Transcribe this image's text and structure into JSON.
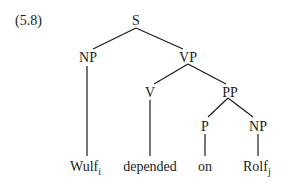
{
  "example_number": "(5.8)",
  "tree": {
    "nodes": [
      {
        "id": "S",
        "label": "S"
      },
      {
        "id": "NP1",
        "label": "NP"
      },
      {
        "id": "VP",
        "label": "VP"
      },
      {
        "id": "V",
        "label": "V"
      },
      {
        "id": "PP",
        "label": "PP"
      },
      {
        "id": "P",
        "label": "P"
      },
      {
        "id": "NP2",
        "label": "NP"
      }
    ],
    "leaves": [
      {
        "id": "w1",
        "text": "Wulf",
        "subscript": "i",
        "parent": "NP1"
      },
      {
        "id": "w2",
        "text": "depended",
        "subscript": "",
        "parent": "V"
      },
      {
        "id": "w3",
        "text": "on",
        "subscript": "",
        "parent": "P"
      },
      {
        "id": "w4",
        "text": "Rolf",
        "subscript": "j",
        "parent": "NP2"
      }
    ],
    "edges": [
      [
        "S",
        "NP1"
      ],
      [
        "S",
        "VP"
      ],
      [
        "VP",
        "V"
      ],
      [
        "VP",
        "PP"
      ],
      [
        "PP",
        "P"
      ],
      [
        "PP",
        "NP2"
      ],
      [
        "NP1",
        "w1"
      ],
      [
        "V",
        "w2"
      ],
      [
        "P",
        "w3"
      ],
      [
        "NP2",
        "w4"
      ]
    ]
  }
}
